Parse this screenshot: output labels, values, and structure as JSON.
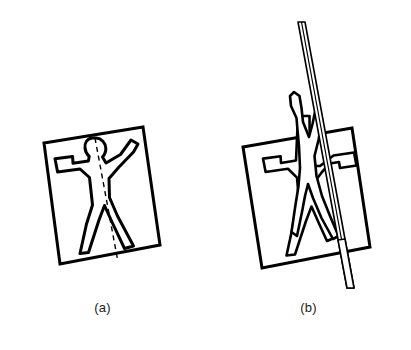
{
  "figure": {
    "kind": "line-diagram",
    "topic": "mirror-symmetry-of-a-human-figure",
    "background_color": "#ffffff",
    "line_color": "#000000",
    "text_color": "#1a1a1a",
    "width": 411,
    "height": 350
  },
  "panels": [
    {
      "id": "a",
      "caption": "(a)",
      "description": "Human figure outline inside a tilted square, with a dashed mirror line running head to crotch",
      "square": {
        "rotation_deg": -8,
        "stroke_width": 3,
        "corners": [
          [
            44,
            143
          ],
          [
            143,
            127
          ],
          [
            160,
            245
          ],
          [
            60,
            264
          ]
        ]
      },
      "mirror_line": {
        "style": "dashed",
        "stroke_width": 1.4,
        "dash_pattern": "5 4",
        "from": [
          95,
          138
        ],
        "to": [
          118,
          262
        ]
      },
      "figure_outline": {
        "stroke_width": 3,
        "fill": "#ffffff",
        "pose": "arms-outstretched-legs-apart"
      }
    },
    {
      "id": "b",
      "caption": "(b)",
      "description": "Same square and figure with a mirror plane drawn edge-on as a thin sheet; the right half of the figure is reflected and folded up out of the plane",
      "square": {
        "rotation_deg": -8,
        "stroke_width": 3,
        "corners": [
          [
            243,
            147
          ],
          [
            352,
            128
          ],
          [
            370,
            247
          ],
          [
            262,
            268
          ]
        ]
      },
      "mirror_plane": {
        "style": "thin-sheet",
        "stroke_width": 1.6,
        "apex": [
          298,
          22
        ],
        "bottom": [
          348,
          288
        ],
        "thickness_px": 5
      },
      "figure_outline": {
        "stroke_width": 2.6,
        "fill": "#ffffff",
        "pose": "left-half-flat-right-half-folded-up"
      }
    }
  ],
  "captions": {
    "a": "(a)",
    "b": "(b)"
  }
}
